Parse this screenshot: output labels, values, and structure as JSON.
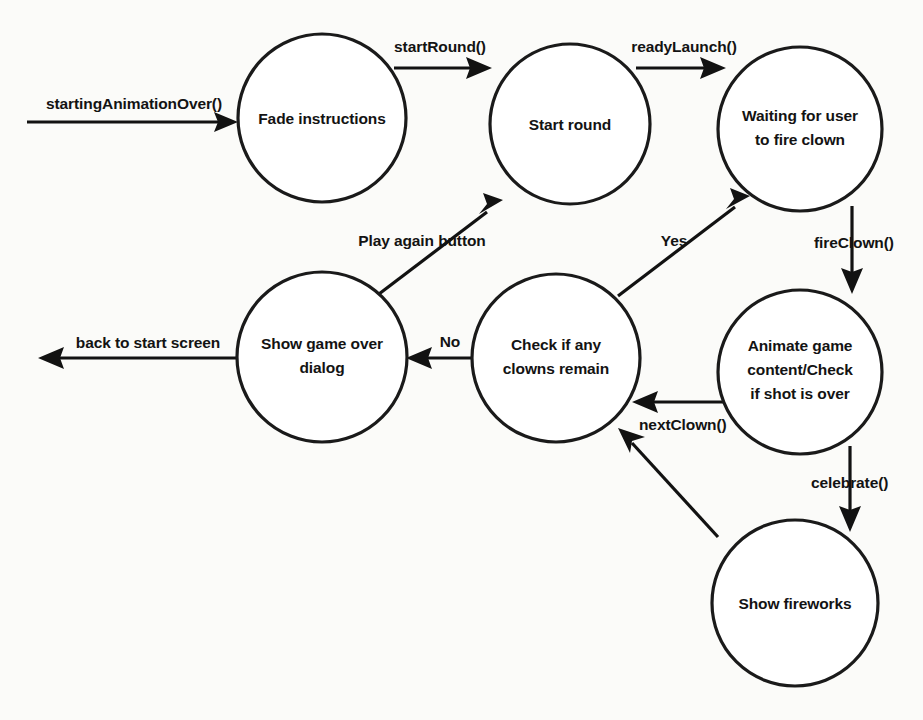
{
  "diagram": {
    "kind": "state-machine-diagram",
    "background_color": "#fbfbf9",
    "stroke_color": "#121212",
    "node_fill_color": "#ffffff",
    "nodes": [
      {
        "id": "fade-instructions",
        "lines": [
          "Fade instructions"
        ],
        "cx": 322,
        "cy": 118,
        "r": 84
      },
      {
        "id": "start-round",
        "lines": [
          "Start round"
        ],
        "cx": 570,
        "cy": 124,
        "r": 80
      },
      {
        "id": "waiting-for-user-to-fire-clown",
        "lines": [
          "Waiting for user",
          "to fire clown"
        ],
        "cx": 800,
        "cy": 129,
        "r": 82
      },
      {
        "id": "show-game-over-dialog",
        "lines": [
          "Show game over",
          "dialog"
        ],
        "cx": 322,
        "cy": 357,
        "r": 85
      },
      {
        "id": "check-if-any-clowns-remain",
        "lines": [
          "Check if any",
          "clowns remain"
        ],
        "cx": 556,
        "cy": 358,
        "r": 84
      },
      {
        "id": "animate-game-content",
        "lines": [
          "Animate game",
          "content/Check",
          "if shot is over"
        ],
        "cx": 800,
        "cy": 372,
        "r": 82
      },
      {
        "id": "show-fireworks",
        "lines": [
          "Show fireworks"
        ],
        "cx": 795,
        "cy": 603,
        "r": 83
      }
    ],
    "edges": [
      {
        "id": "entry-to-fade-instructions",
        "label": "startingAnimationOver()",
        "from": "external-start",
        "to": "fade-instructions",
        "label_x": 134,
        "label_y": 105
      },
      {
        "id": "fade-instructions-to-start-round",
        "label": "startRound()",
        "from": "fade-instructions",
        "to": "start-round",
        "label_x": 440,
        "label_y": 48
      },
      {
        "id": "start-round-to-waiting",
        "label": "readyLaunch()",
        "from": "start-round",
        "to": "waiting-for-user-to-fire-clown",
        "label_x": 684,
        "label_y": 48
      },
      {
        "id": "waiting-to-animate",
        "label": "fireClown()",
        "from": "waiting-for-user-to-fire-clown",
        "to": "animate-game-content",
        "label_x": 853,
        "label_y": 244
      },
      {
        "id": "animate-to-show-fireworks",
        "label": "celebrate()",
        "from": "animate-game-content",
        "to": "show-fireworks",
        "label_x": 850,
        "label_y": 484
      },
      {
        "id": "animate-to-check",
        "label": "nextClown()",
        "from": "animate-game-content",
        "to": "check-if-any-clowns-remain",
        "label_x": 685,
        "label_y": 426
      },
      {
        "id": "show-fireworks-to-check",
        "label": "",
        "from": "show-fireworks",
        "to": "check-if-any-clowns-remain",
        "label_x": 0,
        "label_y": 0
      },
      {
        "id": "check-to-waiting-yes",
        "label": "Yes",
        "from": "check-if-any-clowns-remain",
        "to": "waiting-for-user-to-fire-clown",
        "label_x": 674,
        "label_y": 242
      },
      {
        "id": "check-to-game-over-no",
        "label": "No",
        "from": "check-if-any-clowns-remain",
        "to": "show-game-over-dialog",
        "label_x": 450,
        "label_y": 345
      },
      {
        "id": "game-over-to-start-round",
        "label": "Play again button",
        "from": "show-game-over-dialog",
        "to": "start-round",
        "label_x": 422,
        "label_y": 242
      },
      {
        "id": "game-over-to-start-screen",
        "label": "back to start screen",
        "from": "show-game-over-dialog",
        "to": "external-start-screen",
        "label_x": 148,
        "label_y": 346
      }
    ]
  }
}
